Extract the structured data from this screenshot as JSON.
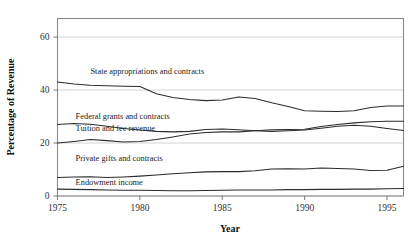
{
  "chart_data": {
    "type": "line",
    "title": "",
    "xlabel": "Year",
    "ylabel": "Percentage of Revenue",
    "xlim": [
      1975,
      1996
    ],
    "ylim": [
      0,
      67
    ],
    "grid": true,
    "legend_position": "inline-labels",
    "x_ticks": [
      "1975",
      "1980",
      "1985",
      "1990",
      "1995"
    ],
    "x_tick_values": [
      1975,
      1980,
      1985,
      1990,
      1995
    ],
    "y_ticks": [
      "0",
      "20",
      "40",
      "60"
    ],
    "y_tick_values": [
      0,
      20,
      40,
      60
    ],
    "x": [
      1975,
      1976,
      1977,
      1978,
      1979,
      1980,
      1981,
      1982,
      1983,
      1984,
      1985,
      1986,
      1987,
      1988,
      1989,
      1990,
      1991,
      1992,
      1993,
      1994,
      1995,
      1996
    ],
    "series": [
      {
        "name": "State appropriations and contracts",
        "label": "State appropriations and contracts",
        "color": "#2b2b2b",
        "label_x": 1977.0,
        "label_y": 46.2,
        "values": [
          43.0,
          42.3,
          41.8,
          41.6,
          41.4,
          41.3,
          38.6,
          37.2,
          36.4,
          36.0,
          36.2,
          37.4,
          36.8,
          35.2,
          33.8,
          32.2,
          32.0,
          31.9,
          32.2,
          33.4,
          34.0,
          34.0
        ]
      },
      {
        "name": "Federal grants and contracts",
        "label": "Federal grants and contracts",
        "color": "#2b2b2b",
        "label_x": 1976.1,
        "label_y": 29.1,
        "values": [
          27.0,
          27.4,
          27.1,
          26.3,
          25.5,
          24.9,
          24.4,
          24.2,
          24.4,
          25.1,
          25.3,
          25.0,
          24.6,
          24.4,
          24.6,
          24.9,
          25.6,
          26.3,
          26.7,
          26.3,
          25.5,
          24.7
        ]
      },
      {
        "name": "Tuition and fee revenue",
        "label": "Tuition and fee revenue",
        "color": "#2b2b2b",
        "label_x": 1976.1,
        "label_y": 24.6,
        "values": [
          20.0,
          20.6,
          21.3,
          20.9,
          20.4,
          20.6,
          21.3,
          22.3,
          23.4,
          24.0,
          24.2,
          24.2,
          24.6,
          25.0,
          25.1,
          25.2,
          26.2,
          27.0,
          27.6,
          28.0,
          28.2,
          28.2
        ]
      },
      {
        "name": "Private gifts and contracts",
        "label": "Private gifts and contracts",
        "color": "#2b2b2b",
        "label_x": 1976.1,
        "label_y": 13.2,
        "values": [
          7.0,
          7.2,
          7.3,
          7.0,
          7.2,
          7.5,
          7.9,
          8.4,
          8.8,
          9.1,
          9.2,
          9.2,
          9.5,
          10.2,
          10.3,
          10.2,
          10.6,
          10.4,
          10.2,
          9.6,
          9.7,
          11.2
        ]
      },
      {
        "name": "Endowment income",
        "label": "Endowment income",
        "color": "#2b2b2b",
        "label_x": 1976.1,
        "label_y": 4.0,
        "values": [
          2.6,
          2.5,
          2.4,
          2.3,
          2.2,
          2.2,
          2.1,
          2.0,
          2.0,
          2.1,
          2.2,
          2.3,
          2.3,
          2.3,
          2.4,
          2.4,
          2.5,
          2.5,
          2.6,
          2.6,
          2.7,
          2.8
        ]
      }
    ]
  }
}
